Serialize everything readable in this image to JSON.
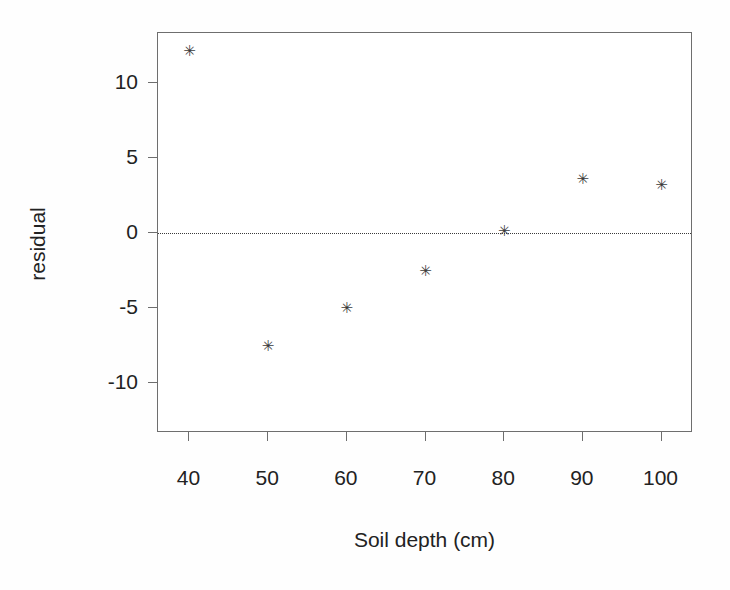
{
  "chart_data": {
    "type": "scatter",
    "title": "",
    "subtitle": "",
    "xlabel": "Soil depth (cm)",
    "ylabel": "residual",
    "x": [
      40,
      50,
      60,
      70,
      80,
      90,
      100
    ],
    "y": [
      12.1,
      -7.5,
      -5.0,
      -2.5,
      0.1,
      3.6,
      3.2
    ],
    "series": [
      {
        "name": "residual",
        "marker": "star",
        "marker_color": "#3b3b3b",
        "points": [
          {
            "x": 40,
            "y": 12.1
          },
          {
            "x": 50,
            "y": -7.5
          },
          {
            "x": 60,
            "y": -5.0
          },
          {
            "x": 70,
            "y": -2.5
          },
          {
            "x": 80,
            "y": 0.1
          },
          {
            "x": 90,
            "y": 3.6
          },
          {
            "x": 100,
            "y": 3.2
          }
        ]
      }
    ],
    "xticks": [
      40,
      50,
      60,
      70,
      80,
      90,
      100
    ],
    "xticklabels": [
      "40",
      "50",
      "60",
      "70",
      "80",
      "90",
      "100"
    ],
    "yticks": [
      10,
      5,
      0,
      -5,
      -10
    ],
    "yticklabels": [
      "10",
      "5",
      "0",
      "-5",
      "-10"
    ],
    "xlim": [
      36,
      104
    ],
    "ylim": [
      -13.3,
      13.3
    ],
    "grid": false,
    "legend": false,
    "legend_position": "none",
    "annotations": [
      {
        "name": "zero-reference-line",
        "type": "hline",
        "value": 0,
        "style": "dotted",
        "color": "#3a3a3a"
      }
    ],
    "frame": {
      "box": true,
      "color": "#6e6e6e"
    }
  },
  "marker_glyph": "✳",
  "colors": {
    "background": "#ffffff",
    "axis": "#6e6e6e",
    "text": "#222222",
    "marker": "#3b3b3b",
    "zero_line": "#3a3a3a"
  }
}
